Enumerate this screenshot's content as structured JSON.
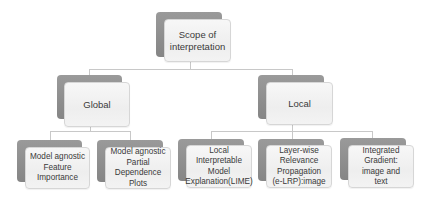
{
  "diagram": {
    "type": "tree",
    "root": {
      "label": "Scope of\ninterpretation"
    },
    "branches": [
      {
        "label": "Global",
        "children": [
          {
            "label": "Model agnostic\nFeature Importance"
          },
          {
            "label": "Model agnostic\nPartial Dependence\nPlots"
          }
        ]
      },
      {
        "label": "Local",
        "children": [
          {
            "label": "Local Interpretable\nModel\nExplanation(LIME)"
          },
          {
            "label": "Layer-wise\nRelevance\nPropagation\n(e-LRP):image"
          },
          {
            "label": "Integrated\nGradient:\nimage and\ntext"
          }
        ]
      }
    ]
  },
  "colors": {
    "back_box": "#8c8c8c",
    "front_box": "#f2f2f2",
    "front_border": "#d6d6d6",
    "connector": "#c8c8c8",
    "text": "#3a3a3a"
  }
}
